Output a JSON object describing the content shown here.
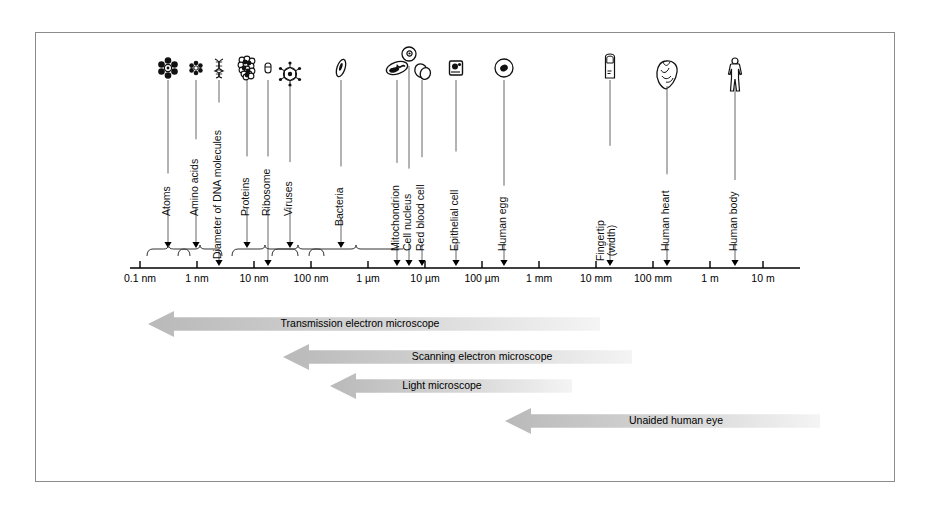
{
  "figure": {
    "border_color": "#8b8b8b",
    "background": "#ffffff"
  },
  "axis": {
    "label": "Size scale (logarithmic)",
    "line_color": "#000000",
    "x_start": 140,
    "x_end": 800,
    "y": 268,
    "tick_spacing": 57,
    "ticks": [
      {
        "label": "0.1 nm",
        "x": 140
      },
      {
        "label": "1 nm",
        "x": 197
      },
      {
        "label": "10 nm",
        "x": 254
      },
      {
        "label": "100 nm",
        "x": 311
      },
      {
        "label": "1 µm",
        "x": 368
      },
      {
        "label": "10 µm",
        "x": 425
      },
      {
        "label": "100 µm",
        "x": 482
      },
      {
        "label": "1 mm",
        "x": 539
      },
      {
        "label": "10 mm",
        "x": 596
      },
      {
        "label": "100 mm",
        "x": 653
      },
      {
        "label": "1 m",
        "x": 710
      },
      {
        "label": "10 m",
        "x": 763
      }
    ]
  },
  "items": [
    {
      "name": "Atoms",
      "icon": "atom-cluster-icon",
      "icon_x": 168,
      "label_x": 168,
      "label_bottom": 205,
      "arrow_x": 168,
      "arrow_top": 86,
      "arrow_end": 248,
      "brace": {
        "x1": 147,
        "x2": 190
      }
    },
    {
      "name": "Amino acids",
      "icon": "amino-acid-icon",
      "icon_x": 196,
      "label_x": 196,
      "label_bottom": 205,
      "arrow_x": 196,
      "arrow_top": 86,
      "arrow_end": 248,
      "brace": {
        "x1": 178,
        "x2": 222
      }
    },
    {
      "name": "Diameter of DNA molecules",
      "icon": "dna-helix-icon",
      "icon_x": 219,
      "label_x": 219,
      "label_bottom": 248,
      "arrow_x": 219,
      "arrow_top": 86,
      "arrow_end": 266,
      "brace": null
    },
    {
      "name": "Proteins",
      "icon": "protein-blob-icon",
      "icon_x": 247,
      "label_x": 247,
      "label_bottom": 205,
      "arrow_x": 247,
      "arrow_top": 86,
      "arrow_end": 248,
      "brace": {
        "x1": 232,
        "x2": 298
      }
    },
    {
      "name": "Ribosome",
      "icon": "ribosome-icon",
      "icon_x": 268,
      "label_x": 268,
      "label_bottom": 205,
      "arrow_x": 268,
      "arrow_top": 86,
      "arrow_end": 266,
      "brace": null
    },
    {
      "name": "Viruses",
      "icon": "virus-icon",
      "icon_x": 290,
      "label_x": 290,
      "label_bottom": 205,
      "arrow_x": 290,
      "arrow_top": 92,
      "arrow_end": 248,
      "brace": {
        "x1": 272,
        "x2": 324
      }
    },
    {
      "name": "Bacteria",
      "icon": "bacteria-rod-icon",
      "icon_x": 341,
      "label_x": 341,
      "label_bottom": 215,
      "arrow_x": 341,
      "arrow_top": 86,
      "arrow_end": 248,
      "brace": {
        "x1": 309,
        "x2": 403,
        "flat": true
      }
    },
    {
      "name": "Mitochondrion",
      "icon": "mitochondrion-icon",
      "icon_x": 397,
      "label_x": 397,
      "label_bottom": 240,
      "arrow_x": 397,
      "arrow_top": 86,
      "arrow_end": 266,
      "brace": null
    },
    {
      "name": "Cell nucleus",
      "icon": "cell-nucleus-icon",
      "icon_x": 409,
      "label_x": 409,
      "label_bottom": 240,
      "arrow_x": 409,
      "arrow_top": 72,
      "arrow_end": 266,
      "brace": null
    },
    {
      "name": "Red blood cell",
      "icon": "red-blood-cell-icon",
      "icon_x": 422,
      "label_x": 422,
      "label_bottom": 240,
      "arrow_x": 422,
      "arrow_top": 86,
      "arrow_end": 266,
      "brace": null
    },
    {
      "name": "Epithelial cell",
      "icon": "epithelial-cell-icon",
      "icon_x": 456,
      "label_x": 456,
      "label_bottom": 240,
      "arrow_x": 456,
      "arrow_top": 86,
      "arrow_end": 266,
      "brace": null
    },
    {
      "name": "Human egg",
      "icon": "human-egg-icon",
      "icon_x": 504,
      "label_x": 504,
      "label_bottom": 240,
      "arrow_x": 504,
      "arrow_top": 86,
      "arrow_end": 266,
      "brace": null
    },
    {
      "name": "Fingertip\n(width)",
      "icon": "fingertip-icon",
      "icon_x": 610,
      "label_x": 610,
      "label_bottom": 240,
      "arrow_x": 610,
      "arrow_top": 86,
      "arrow_end": 266,
      "brace": null,
      "two_line": true
    },
    {
      "name": "Human heart",
      "icon": "human-heart-icon",
      "icon_x": 667,
      "label_x": 667,
      "label_bottom": 240,
      "arrow_x": 667,
      "arrow_top": 92,
      "arrow_end": 266,
      "brace": null
    },
    {
      "name": "Human body",
      "icon": "human-body-icon",
      "icon_x": 735,
      "label_x": 735,
      "label_bottom": 240,
      "arrow_x": 735,
      "arrow_top": 92,
      "arrow_end": 266,
      "brace": null
    }
  ],
  "instrument_ranges": [
    {
      "label": "Transmission electron microscope",
      "tip_x": 148,
      "right_x": 600,
      "y": 311,
      "height": 26,
      "text_x": 360
    },
    {
      "label": "Scanning electron microscope",
      "tip_x": 283,
      "right_x": 632,
      "y": 344,
      "height": 26,
      "text_x": 482
    },
    {
      "label": "Light microscope",
      "tip_x": 330,
      "right_x": 572,
      "y": 373,
      "height": 26,
      "text_x": 442
    },
    {
      "label": "Unaided human eye",
      "tip_x": 505,
      "right_x": 820,
      "y": 408,
      "height": 26,
      "text_x": 676
    }
  ],
  "colors": {
    "arrow_gray": "#b9b9b9",
    "arrow_fade": "#f4f4f4",
    "line": "#000000",
    "leader": "#555555"
  }
}
